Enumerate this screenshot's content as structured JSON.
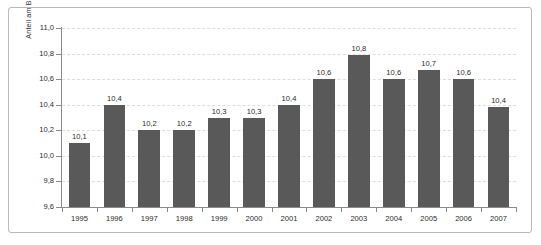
{
  "chart_data": {
    "type": "bar",
    "title": "",
    "subtitle": "",
    "xlabel": "",
    "ylabel": "Anteil am BIP in Prozent",
    "categories": [
      "1995",
      "1996",
      "1997",
      "1998",
      "1999",
      "2000",
      "2001",
      "2002",
      "2003",
      "2004",
      "2005",
      "2006",
      "2007"
    ],
    "values": [
      10.1,
      10.4,
      10.2,
      10.2,
      10.3,
      10.3,
      10.4,
      10.6,
      10.79,
      10.6,
      10.67,
      10.6,
      10.38
    ],
    "data_labels": [
      "10,1",
      "10,4",
      "10,2",
      "10,2",
      "10,3",
      "10,3",
      "10,4",
      "10,6",
      "10,8",
      "10,6",
      "10,7",
      "10,6",
      "10,4"
    ],
    "ylim": [
      9.6,
      11.0
    ],
    "ytick_values": [
      9.6,
      9.8,
      10.0,
      10.2,
      10.4,
      10.6,
      10.8,
      11.0
    ],
    "ytick_labels": [
      "9,6",
      "9,8",
      "10,0",
      "10,2",
      "10,4",
      "10,6",
      "10,8",
      "11,0"
    ],
    "grid": true,
    "grid_style": "dashed",
    "legend": "none",
    "bar_color": "#595959",
    "grid_color": "#dddddd",
    "axis_color": "#8a8a8a",
    "text_color": "#2b2b2b",
    "background_color": "#ffffff",
    "border_color": "#b9b9b9"
  }
}
